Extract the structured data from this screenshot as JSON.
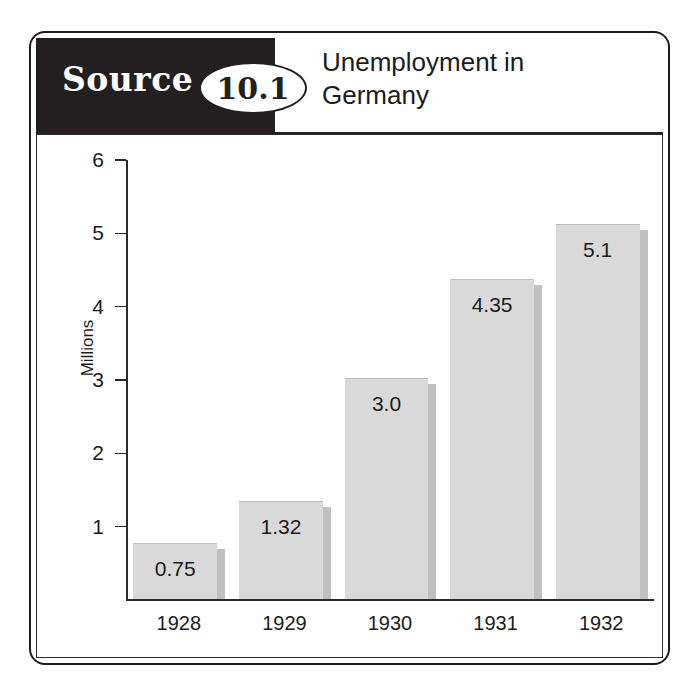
{
  "figure": {
    "source_label": "Source",
    "source_number": "10.1",
    "title_line1": "Unemployment in",
    "title_line2": "Germany"
  },
  "colors": {
    "band": "#231f20",
    "bar_fill": "#d9d9d9",
    "bar_shadow": "#c0c0c0",
    "axis": "#2b2b2b",
    "text": "#1b1b1b"
  },
  "chart_data": {
    "type": "bar",
    "title": "Unemployment in Germany",
    "xlabel": "",
    "ylabel": "Millions",
    "categories": [
      "1928",
      "1929",
      "1930",
      "1931",
      "1932"
    ],
    "values": [
      0.75,
      1.32,
      3.0,
      4.35,
      5.1
    ],
    "value_labels": [
      "0.75",
      "1.32",
      "3.0",
      "4.35",
      "5.1"
    ],
    "ylim": [
      0,
      6
    ],
    "yticks": [
      1,
      2,
      3,
      4,
      5,
      6
    ],
    "ytick_labels": [
      "1",
      "2",
      "3",
      "4",
      "5",
      "6"
    ],
    "grid": false,
    "legend": false
  }
}
